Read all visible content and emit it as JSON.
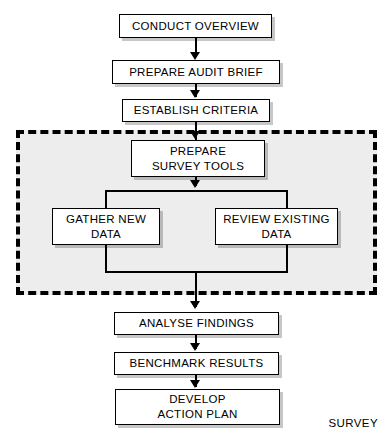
{
  "diagram": {
    "colors": {
      "box_fill": "#ffffff",
      "box_stroke": "#000000",
      "region_fill": "#ededec",
      "region_stroke": "#000000",
      "text": "#000000"
    },
    "group": {
      "label": "SURVEY",
      "style": "dashed"
    },
    "nodes": [
      {
        "id": "conduct-overview",
        "label": "CONDUCT OVERVIEW"
      },
      {
        "id": "prepare-audit-brief",
        "label": "PREPARE AUDIT BRIEF"
      },
      {
        "id": "establish-criteria",
        "label": "ESTABLISH CRITERIA"
      },
      {
        "id": "prepare-survey-tools",
        "label": "PREPARE\nSURVEY TOOLS"
      },
      {
        "id": "gather-new-data",
        "label": "GATHER NEW\nDATA"
      },
      {
        "id": "review-existing-data",
        "label": "REVIEW EXISTING\nDATA"
      },
      {
        "id": "analyse-findings",
        "label": "ANALYSE FINDINGS"
      },
      {
        "id": "benchmark-results",
        "label": "BENCHMARK RESULTS"
      },
      {
        "id": "develop-action-plan",
        "label": "DEVELOP\nACTION PLAN"
      }
    ],
    "edges": [
      {
        "from": "conduct-overview",
        "to": "prepare-audit-brief"
      },
      {
        "from": "prepare-audit-brief",
        "to": "establish-criteria"
      },
      {
        "from": "establish-criteria",
        "to": "prepare-survey-tools"
      },
      {
        "from": "prepare-survey-tools",
        "to": "gather-new-data"
      },
      {
        "from": "prepare-survey-tools",
        "to": "review-existing-data"
      },
      {
        "from": "gather-new-data",
        "to": "analyse-findings"
      },
      {
        "from": "review-existing-data",
        "to": "analyse-findings"
      },
      {
        "from": "analyse-findings",
        "to": "benchmark-results"
      },
      {
        "from": "benchmark-results",
        "to": "develop-action-plan"
      }
    ],
    "caption": ""
  }
}
